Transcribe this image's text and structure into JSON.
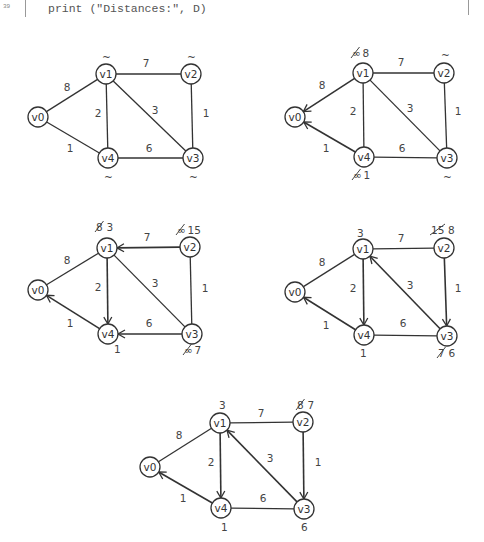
{
  "code": {
    "line_number": "39",
    "text": "print (\"Distances:\", D)"
  },
  "colors": {
    "stroke": "#333333",
    "text": "#444444",
    "background": "#ffffff"
  },
  "graphs": [
    {
      "id": "step-1",
      "nodes": {
        "v0": [
          38,
          117
        ],
        "v1": [
          106,
          74
        ],
        "v2": [
          191,
          74
        ],
        "v3": [
          193,
          158
        ],
        "v4": [
          108,
          158
        ]
      },
      "edges": [
        {
          "from": "v0",
          "to": "v1",
          "w": "8",
          "directed": false,
          "label": [
            67,
            87
          ]
        },
        {
          "from": "v1",
          "to": "v2",
          "w": "7",
          "directed": false,
          "label": [
            146,
            63
          ]
        },
        {
          "from": "v1",
          "to": "v4",
          "w": "2",
          "directed": false,
          "label": [
            98,
            113
          ]
        },
        {
          "from": "v1",
          "to": "v3",
          "w": "3",
          "directed": false,
          "label": [
            155,
            110
          ]
        },
        {
          "from": "v2",
          "to": "v3",
          "w": "1",
          "directed": false,
          "label": [
            206,
            113
          ]
        },
        {
          "from": "v0",
          "to": "v4",
          "w": "1",
          "directed": false,
          "label": [
            70,
            148
          ]
        },
        {
          "from": "v4",
          "to": "v3",
          "w": "6",
          "directed": false,
          "label": [
            149,
            148
          ]
        }
      ],
      "annotations": [
        {
          "node": "v1",
          "pos": [
            106,
            57
          ],
          "parts": [
            {
              "text": "~"
            }
          ]
        },
        {
          "node": "v2",
          "pos": [
            191,
            57
          ],
          "parts": [
            {
              "text": "~"
            }
          ]
        },
        {
          "node": "v4",
          "pos": [
            108,
            177
          ],
          "parts": [
            {
              "text": "~"
            }
          ]
        },
        {
          "node": "v3",
          "pos": [
            193,
            177
          ],
          "parts": [
            {
              "text": "~"
            }
          ]
        }
      ]
    },
    {
      "id": "step-2",
      "nodes": {
        "v0": [
          295,
          117
        ],
        "v1": [
          363,
          73
        ],
        "v2": [
          444,
          73
        ],
        "v3": [
          447,
          158
        ],
        "v4": [
          364,
          157
        ]
      },
      "edges": [
        {
          "from": "v1",
          "to": "v0",
          "w": "8",
          "directed": true,
          "label": [
            322,
            85
          ]
        },
        {
          "from": "v1",
          "to": "v2",
          "w": "7",
          "directed": false,
          "label": [
            401,
            62
          ]
        },
        {
          "from": "v1",
          "to": "v4",
          "w": "2",
          "directed": false,
          "label": [
            353,
            111
          ]
        },
        {
          "from": "v1",
          "to": "v3",
          "w": "3",
          "directed": false,
          "label": [
            410,
            108
          ]
        },
        {
          "from": "v2",
          "to": "v3",
          "w": "1",
          "directed": false,
          "label": [
            458,
            111
          ]
        },
        {
          "from": "v4",
          "to": "v0",
          "w": "1",
          "directed": true,
          "label": [
            326,
            148
          ]
        },
        {
          "from": "v4",
          "to": "v3",
          "w": "6",
          "directed": false,
          "label": [
            402,
            148
          ]
        }
      ],
      "annotations": [
        {
          "node": "v1",
          "pos": [
            360,
            53
          ],
          "parts": [
            {
              "text": "∞",
              "struck": true
            },
            {
              "text": "8"
            }
          ]
        },
        {
          "node": "v2",
          "pos": [
            445,
            55
          ],
          "parts": [
            {
              "text": "~"
            }
          ]
        },
        {
          "node": "v4",
          "pos": [
            361,
            175
          ],
          "parts": [
            {
              "text": "∞",
              "struck": true
            },
            {
              "text": "1"
            }
          ]
        },
        {
          "node": "v3",
          "pos": [
            447,
            177
          ],
          "parts": [
            {
              "text": "~"
            }
          ]
        }
      ]
    },
    {
      "id": "step-3",
      "nodes": {
        "v0": [
          38,
          290
        ],
        "v1": [
          107,
          248
        ],
        "v2": [
          190,
          247
        ],
        "v3": [
          192,
          334
        ],
        "v4": [
          108,
          334
        ]
      },
      "edges": [
        {
          "from": "v0",
          "to": "v1",
          "w": "8",
          "directed": false,
          "label": [
            67,
            260
          ]
        },
        {
          "from": "v2",
          "to": "v1",
          "w": "7",
          "directed": true,
          "label": [
            147,
            237
          ]
        },
        {
          "from": "v1",
          "to": "v4",
          "w": "2",
          "directed": true,
          "label": [
            98,
            287
          ]
        },
        {
          "from": "v1",
          "to": "v3",
          "w": "3",
          "directed": false,
          "label": [
            155,
            283
          ]
        },
        {
          "from": "v2",
          "to": "v3",
          "w": "1",
          "directed": false,
          "label": [
            205,
            288
          ]
        },
        {
          "from": "v4",
          "to": "v0",
          "w": "1",
          "directed": true,
          "label": [
            70,
            323
          ]
        },
        {
          "from": "v3",
          "to": "v4",
          "w": "6",
          "directed": true,
          "label": [
            149,
            323
          ]
        }
      ],
      "annotations": [
        {
          "node": "v1",
          "pos": [
            104,
            227
          ],
          "parts": [
            {
              "text": "8",
              "struck": true
            },
            {
              "text": "3"
            }
          ]
        },
        {
          "node": "v2",
          "pos": [
            189,
            230
          ],
          "parts": [
            {
              "text": "∞",
              "struck": true
            },
            {
              "text": "15"
            }
          ]
        },
        {
          "node": "v4",
          "pos": [
            118,
            349
          ],
          "parts": [
            {
              "text": "1"
            }
          ]
        },
        {
          "node": "v3",
          "pos": [
            192,
            350
          ],
          "parts": [
            {
              "text": "∞",
              "struck": true
            },
            {
              "text": "7"
            }
          ]
        }
      ]
    },
    {
      "id": "step-4",
      "nodes": {
        "v0": [
          295,
          292
        ],
        "v1": [
          363,
          249
        ],
        "v2": [
          444,
          248
        ],
        "v3": [
          447,
          336
        ],
        "v4": [
          364,
          335
        ]
      },
      "edges": [
        {
          "from": "v0",
          "to": "v1",
          "w": "8",
          "directed": false,
          "label": [
            322,
            262
          ]
        },
        {
          "from": "v1",
          "to": "v2",
          "w": "7",
          "directed": false,
          "label": [
            401,
            238
          ]
        },
        {
          "from": "v1",
          "to": "v4",
          "w": "2",
          "directed": true,
          "label": [
            353,
            288
          ]
        },
        {
          "from": "v3",
          "to": "v1",
          "w": "3",
          "directed": true,
          "label": [
            410,
            285
          ]
        },
        {
          "from": "v2",
          "to": "v3",
          "w": "1",
          "directed": true,
          "label": [
            458,
            288
          ]
        },
        {
          "from": "v4",
          "to": "v0",
          "w": "1",
          "directed": true,
          "label": [
            326,
            325
          ]
        },
        {
          "from": "v4",
          "to": "v3",
          "w": "6",
          "directed": false,
          "label": [
            403,
            323
          ]
        }
      ],
      "annotations": [
        {
          "node": "v1",
          "pos": [
            361,
            233
          ],
          "parts": [
            {
              "text": "3"
            }
          ]
        },
        {
          "node": "v2",
          "pos": [
            443,
            230
          ],
          "parts": [
            {
              "text": "15",
              "struck": true
            },
            {
              "text": "8"
            }
          ]
        },
        {
          "node": "v4",
          "pos": [
            364,
            353
          ],
          "parts": [
            {
              "text": "1"
            }
          ]
        },
        {
          "node": "v3",
          "pos": [
            446,
            353
          ],
          "parts": [
            {
              "text": "7",
              "struck": true
            },
            {
              "text": "6"
            }
          ]
        }
      ]
    },
    {
      "id": "step-5",
      "nodes": {
        "v0": [
          150,
          467
        ],
        "v1": [
          220,
          423
        ],
        "v2": [
          303,
          422
        ],
        "v3": [
          304,
          509
        ],
        "v4": [
          221,
          508
        ]
      },
      "edges": [
        {
          "from": "v0",
          "to": "v1",
          "w": "8",
          "directed": false,
          "label": [
            179,
            435
          ]
        },
        {
          "from": "v1",
          "to": "v2",
          "w": "7",
          "directed": false,
          "label": [
            261,
            413
          ]
        },
        {
          "from": "v1",
          "to": "v4",
          "w": "2",
          "directed": true,
          "label": [
            211,
            462
          ]
        },
        {
          "from": "v3",
          "to": "v1",
          "w": "3",
          "directed": true,
          "label": [
            270,
            458
          ]
        },
        {
          "from": "v2",
          "to": "v3",
          "w": "1",
          "directed": true,
          "label": [
            318,
            462
          ]
        },
        {
          "from": "v4",
          "to": "v0",
          "w": "1",
          "directed": true,
          "label": [
            183,
            498
          ]
        },
        {
          "from": "v4",
          "to": "v3",
          "w": "6",
          "directed": false,
          "label": [
            263,
            498
          ]
        }
      ],
      "annotations": [
        {
          "node": "v1",
          "pos": [
            223,
            405
          ],
          "parts": [
            {
              "text": "3"
            }
          ]
        },
        {
          "node": "v2",
          "pos": [
            305,
            405
          ],
          "parts": [
            {
              "text": "8",
              "struck": true
            },
            {
              "text": "7"
            }
          ]
        },
        {
          "node": "v4",
          "pos": [
            225,
            527
          ],
          "parts": [
            {
              "text": "1"
            }
          ]
        },
        {
          "node": "v3",
          "pos": [
            305,
            527
          ],
          "parts": [
            {
              "text": "6"
            }
          ]
        }
      ]
    }
  ]
}
